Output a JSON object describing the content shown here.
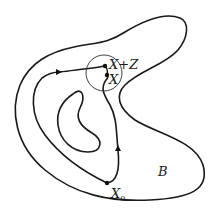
{
  "diagram": {
    "region_label": "B",
    "points": {
      "start": {
        "label": "X",
        "subscript": "0"
      },
      "current": {
        "label": "X"
      },
      "perturbed": {
        "label": "X+Z"
      }
    },
    "elements": {
      "outer_boundary": "closed curve bounding region B",
      "inner_hole": "kidney-shaped inner boundary",
      "path": "directed path from X0 to X with arrows",
      "neighborhood": "small circle around X"
    },
    "colors": {
      "stroke": "#1a1a1a",
      "background": "#ffffff"
    }
  }
}
